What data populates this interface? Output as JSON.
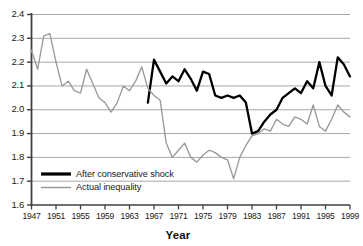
{
  "chart_data": {
    "type": "line",
    "title": "",
    "xlabel": "Year",
    "ylabel": "",
    "xlim": [
      1947,
      1999
    ],
    "ylim": [
      1.6,
      2.4
    ],
    "grid": true,
    "grid_axis": "y",
    "legend_position": "bottom-left",
    "y_ticks": [
      "2.4",
      "2.3",
      "2.2",
      "2.1",
      "2.0",
      "1.9",
      "1.8",
      "1.7",
      "1.6"
    ],
    "y_tick_values": [
      2.4,
      2.3,
      2.2,
      2.1,
      2.0,
      1.9,
      1.8,
      1.7,
      1.6
    ],
    "x_ticks": [
      "1947",
      "1951",
      "1955",
      "1959",
      "1963",
      "1967",
      "1971",
      "1975",
      "1979",
      "1983",
      "1987",
      "1991",
      "1995",
      "1999"
    ],
    "x_tick_values": [
      1947,
      1951,
      1955,
      1959,
      1963,
      1967,
      1971,
      1975,
      1979,
      1983,
      1987,
      1991,
      1995,
      1999
    ],
    "colors": {
      "after_conservative_shock": "#000000",
      "actual_inequality": "#9a9a9a",
      "gridline": "#a9a9a9",
      "axis": "#404040"
    },
    "series": [
      {
        "name": "After conservative shock",
        "color": "#000000",
        "x": [
          1966,
          1967,
          1968,
          1969,
          1970,
          1971,
          1972,
          1973,
          1974,
          1975,
          1976,
          1977,
          1978,
          1979,
          1980,
          1981,
          1982,
          1983,
          1984,
          1985,
          1986,
          1987,
          1988,
          1989,
          1990,
          1991,
          1992,
          1993,
          1994,
          1995,
          1996,
          1997,
          1998,
          1999
        ],
        "values": [
          2.03,
          2.21,
          2.16,
          2.11,
          2.14,
          2.12,
          2.17,
          2.13,
          2.08,
          2.16,
          2.15,
          2.06,
          2.05,
          2.06,
          2.05,
          2.06,
          2.03,
          1.9,
          1.91,
          1.95,
          1.98,
          2.0,
          2.05,
          2.07,
          2.09,
          2.07,
          2.12,
          2.09,
          2.2,
          2.1,
          2.06,
          2.22,
          2.19,
          2.14
        ]
      },
      {
        "name": "Actual inequality",
        "color": "#9a9a9a",
        "x": [
          1947,
          1948,
          1949,
          1950,
          1951,
          1952,
          1953,
          1954,
          1955,
          1956,
          1957,
          1958,
          1959,
          1960,
          1961,
          1962,
          1963,
          1964,
          1965,
          1966,
          1967,
          1968,
          1969,
          1970,
          1971,
          1972,
          1973,
          1974,
          1975,
          1976,
          1977,
          1978,
          1979,
          1980,
          1981,
          1982,
          1983,
          1984,
          1985,
          1986,
          1987,
          1988,
          1989,
          1990,
          1991,
          1992,
          1993,
          1994,
          1995,
          1996,
          1997,
          1998,
          1999
        ],
        "values": [
          2.25,
          2.17,
          2.31,
          2.32,
          2.2,
          2.1,
          2.12,
          2.08,
          2.07,
          2.17,
          2.11,
          2.05,
          2.03,
          1.99,
          2.03,
          2.1,
          2.08,
          2.12,
          2.18,
          2.09,
          2.06,
          2.04,
          1.86,
          1.8,
          1.83,
          1.86,
          1.8,
          1.78,
          1.81,
          1.83,
          1.82,
          1.8,
          1.79,
          1.71,
          1.8,
          1.85,
          1.89,
          1.9,
          1.92,
          1.91,
          1.96,
          1.94,
          1.93,
          1.97,
          1.96,
          1.94,
          2.02,
          1.93,
          1.91,
          1.96,
          2.02,
          1.99,
          1.97
        ]
      }
    ]
  },
  "legend": {
    "items": [
      {
        "label": "After conservative shock",
        "color": "#000000"
      },
      {
        "label": "Actual inequality",
        "color": "#9a9a9a"
      }
    ]
  },
  "axis_title_x": "Year"
}
